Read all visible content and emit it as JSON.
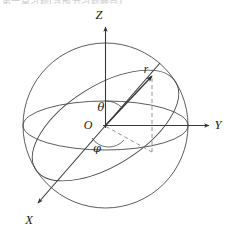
{
  "figure": {
    "clipped_header_text": "第一章习题(含部分习题解答)⑥",
    "background_color": "#ffffff",
    "ink_color": "#333333",
    "dash_color": "#8a8a8a"
  },
  "axes": [
    {
      "key": "z",
      "label": "Z",
      "direction": "up",
      "x": 99,
      "y": 19
    },
    {
      "key": "y",
      "label": "Y",
      "direction": "right",
      "x": 218,
      "y": 129
    },
    {
      "key": "x",
      "label": "X",
      "direction": "down-left",
      "x": 29,
      "y": 224
    }
  ],
  "origin": {
    "label": "O",
    "x": 88,
    "y": 129
  },
  "vectors": [
    {
      "key": "r",
      "label": "r",
      "x": 146,
      "y": 73,
      "description": "radius vector to point on sphere"
    }
  ],
  "angles": [
    {
      "key": "theta",
      "label": "θ",
      "x": 101,
      "y": 111,
      "description": "polar angle from Z axis"
    },
    {
      "key": "phi",
      "label": "φ",
      "x": 97,
      "y": 152,
      "description": "azimuthal angle in XY plane"
    }
  ],
  "shapes": {
    "sphere": {
      "cx": 105.5,
      "cy": 125.5,
      "r": 82.5
    },
    "equator_ellipse": {
      "cx": 105.5,
      "cy": 125.5,
      "rx": 82.5,
      "ry": 24.5
    },
    "tilted_great_circle": {
      "cx": 105.5,
      "cy": 125.5,
      "rx": 82.5,
      "ry": 40.0,
      "rotation_deg": -32
    },
    "dashed_vertical": {
      "x": 152,
      "y1": 78,
      "y2": 152
    },
    "dashed_projection": {
      "x1": 105.5,
      "y1": 125.5,
      "x2": 152,
      "y2": 152
    }
  },
  "colors": {
    "outline": "#4a4a4a",
    "axis": "#3a3a3a",
    "vector": "#333333",
    "dashed": "#8a8a8a",
    "text": "#1a1a1a"
  }
}
